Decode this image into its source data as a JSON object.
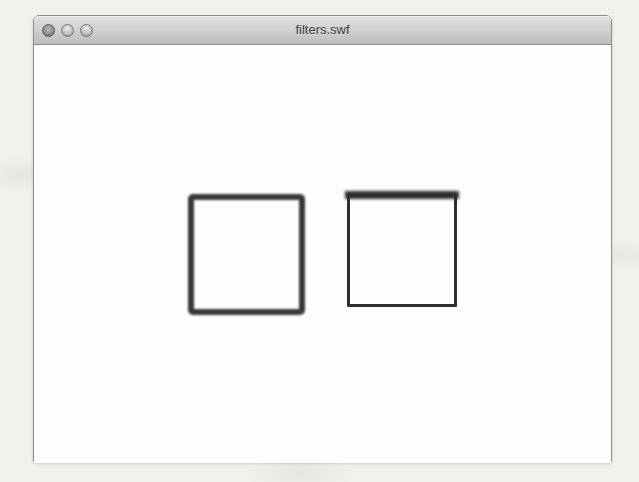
{
  "window": {
    "title": "filters.swf",
    "controls": [
      {
        "name": "close"
      },
      {
        "name": "minimize"
      },
      {
        "name": "zoom"
      }
    ]
  },
  "stage": {
    "description": "Flash movie stage showing two outlined squares demonstrating filter effects",
    "shapes": [
      {
        "id": "square-uniform-blur",
        "type": "rect",
        "x": 154,
        "y": 149,
        "width": 117,
        "height": 121,
        "border_width": 6,
        "border_color": "#383836",
        "fill": "#fefefd",
        "corner_radius": 5,
        "blur": 1.1,
        "top_bar_height": 0,
        "top_bar_blur": 0
      },
      {
        "id": "square-top-blur",
        "type": "rect",
        "x": 313,
        "y": 149,
        "width": 110,
        "height": 113,
        "border_width": 3,
        "border_color": "#2e2e2c",
        "fill": "#fefefd",
        "corner_radius": 1,
        "blur": 0.4,
        "top_bar_height": 8,
        "top_bar_blur": 1.7
      }
    ]
  },
  "colors": {
    "page_background": "#f2f1ee",
    "window_background": "#fdfdfc",
    "titlebar_top": "#e0e0de",
    "titlebar_bottom": "#bcbcba",
    "window_border": "#8f8f8c",
    "title_text": "#3a3a38",
    "shape_border": "#333331"
  }
}
